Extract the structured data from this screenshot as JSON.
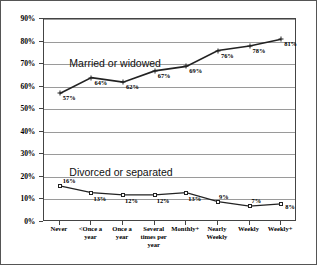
{
  "chart_data": {
    "type": "line",
    "title": "",
    "xlabel": "",
    "ylabel": "",
    "ylim": [
      0,
      90
    ],
    "ytick_step": 10,
    "grid": true,
    "legend_position": "in-plot annotations",
    "categories": [
      "Never",
      "<Once a\nyear",
      "Once a\nyear",
      "Several\ntimes per\nyear",
      "Monthly+",
      "Nearly\nWeekly",
      "Weekly",
      "Weekly+"
    ],
    "ytick_labels": [
      "0%",
      "10%",
      "20%",
      "30%",
      "40%",
      "50%",
      "60%",
      "70%",
      "80%",
      "90%"
    ],
    "ytick_values": [
      0,
      10,
      20,
      30,
      40,
      50,
      60,
      70,
      80,
      90
    ],
    "series": [
      {
        "name": "Married or widowed",
        "marker": "cross",
        "values": [
          57,
          64,
          62,
          67,
          69,
          76,
          78,
          81
        ],
        "point_labels": [
          "57%",
          "64%",
          "62%",
          "67%",
          "69%",
          "76%",
          "78%",
          "81%"
        ]
      },
      {
        "name": "Divorced or separated",
        "marker": "open-square",
        "values": [
          16,
          13,
          12,
          12,
          13,
          9,
          7,
          8
        ],
        "point_labels": [
          "16%",
          "13%",
          "12%",
          "12%",
          "13%",
          "9%",
          "7%",
          "8%"
        ]
      }
    ],
    "annotations": [
      {
        "text": "Married or widowed",
        "x_frac": 0.1,
        "y_value": 73
      },
      {
        "text": "Divorced or separated",
        "x_frac": 0.1,
        "y_value": 25
      }
    ],
    "colors": {
      "line": "#222222",
      "grid": "#9a9a9a",
      "axis": "#444444",
      "background": "#ffffff"
    }
  }
}
